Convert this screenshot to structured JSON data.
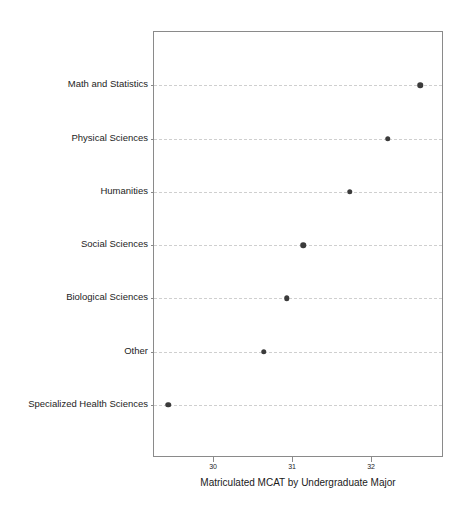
{
  "chart_data": {
    "type": "scatter",
    "title": "",
    "xlabel": "Matriculated MCAT by Undergraduate Major",
    "ylabel": "",
    "xlim": [
      29.24,
      32.91
    ],
    "ylim": [
      0,
      8
    ],
    "grid": true,
    "legend": null,
    "orientation": "horizontal",
    "marker": "circle",
    "marker_color": "#3b3b3b",
    "xticks": [
      30,
      31,
      32
    ],
    "xticklabels": [
      "30",
      "31",
      "32"
    ],
    "categories": [
      "Math and Statistics",
      "Physical Sciences",
      "Humanities",
      "Social Sciences",
      "Biological Sciences",
      "Other",
      "Specialized Health Sciences"
    ],
    "values": [
      32.61,
      32.2,
      31.72,
      31.13,
      30.92,
      30.63,
      29.42
    ],
    "points": [
      {
        "category": "Math and Statistics",
        "value": 32.61
      },
      {
        "category": "Physical Sciences",
        "value": 32.2
      },
      {
        "category": "Humanities",
        "value": 31.72
      },
      {
        "category": "Social Sciences",
        "value": 31.13
      },
      {
        "category": "Biological Sciences",
        "value": 30.92
      },
      {
        "category": "Other",
        "value": 30.63
      },
      {
        "category": "Specialized Health Sciences",
        "value": 29.42
      }
    ]
  },
  "figure": {
    "background_color": "#ffffff",
    "frame_color": "#8a8a8a",
    "gridline_color": "#cfcfcf"
  }
}
